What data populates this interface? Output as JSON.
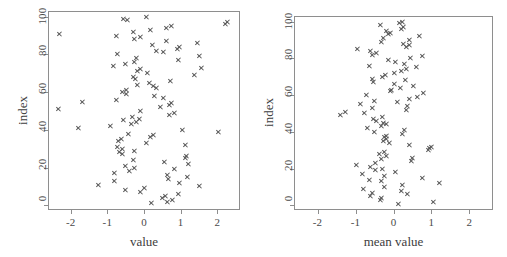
{
  "figure": {
    "width": 507,
    "height": 257,
    "background": "#ffffff",
    "marker_color": "#555555",
    "axis_color": "#8e8e8e",
    "text_color": "#3d3d3d",
    "marker_symbol": "x"
  },
  "chart_data": [
    {
      "type": "scatter",
      "title": "",
      "xlabel": "value",
      "ylabel": "index",
      "xlim": [
        -2.62,
        2.62
      ],
      "ylim": [
        -2.5,
        103
      ],
      "xticks": [
        -2,
        -1,
        0,
        1,
        2
      ],
      "xtick_labels": [
        "-2",
        "-1",
        "0",
        "1",
        "2"
      ],
      "yticks": [
        0,
        20,
        40,
        60,
        80,
        100
      ],
      "ytick_labels": [
        "0",
        "20",
        "40",
        "60",
        "80",
        "100"
      ],
      "grid": false,
      "legend": null,
      "marker": "x",
      "n_points": 100,
      "x": [
        0.21,
        0.63,
        0.78,
        0.5,
        0.57,
        0.94,
        -0.11,
        -0.52,
        0.01,
        1.51,
        -1.25,
        0.95,
        -0.8,
        0.67,
        1.18,
        0.63,
        -0.82,
        -0.4,
        0.82,
        -0.27,
        -0.51,
        1.2,
        0.56,
        -0.3,
        1.12,
        1.15,
        -0.58,
        -0.67,
        -0.26,
        -0.58,
        -0.74,
        1.13,
        0.06,
        -0.7,
        -0.63,
        0.18,
        0.26,
        -0.43,
        2.03,
        1.05,
        -1.8,
        -0.92,
        -0.36,
        -0.22,
        -0.57,
        -0.13,
        -0.33,
        0.7,
        0.83,
        -0.09,
        -2.35,
        0.44,
        0.7,
        0.74,
        -1.68,
        -0.75,
        0.52,
        0.29,
        -0.47,
        -0.59,
        -0.48,
        0.33,
        0.25,
        -0.19,
        0.15,
        0.72,
        -0.24,
        -0.3,
        1.37,
        0.08,
        -0.18,
        -0.11,
        1.57,
        -0.84,
        -0.5,
        -0.26,
        0.93,
        -0.22,
        1.5,
        -0.73,
        0.52,
        0.33,
        0.9,
        0.96,
        0.23,
        1.46,
        0.61,
        -0.27,
        -0.09,
        -0.76,
        -2.3,
        -0.29,
        0.18,
        0.61,
        0.74,
        2.22,
        2.27,
        -0.45,
        -0.57,
        0.05
      ],
      "y": [
        1,
        2,
        3,
        4,
        5,
        6,
        7,
        8,
        9,
        10,
        11,
        12,
        13,
        14,
        15,
        16,
        17,
        18,
        19,
        20,
        21,
        22,
        23,
        24,
        25,
        26,
        27,
        28,
        29,
        30,
        31,
        32,
        33,
        34,
        35,
        36,
        37,
        38,
        39,
        40,
        41,
        42,
        43,
        44,
        45,
        46,
        47,
        48,
        49,
        50,
        51,
        52,
        53,
        54,
        55,
        56,
        57,
        58,
        59,
        60,
        61,
        62,
        63,
        64,
        65,
        66,
        67,
        68,
        69,
        70,
        71,
        72,
        73,
        74,
        75,
        76,
        77,
        78,
        79,
        80,
        81,
        82,
        83,
        84,
        85,
        86,
        87,
        88,
        89,
        90,
        91,
        92,
        93,
        94,
        95,
        96,
        97,
        98,
        99,
        100
      ]
    },
    {
      "type": "scatter",
      "title": "",
      "xlabel": "mean value",
      "ylabel": "index",
      "xlim": [
        -2.62,
        2.62
      ],
      "ylim": [
        -2.5,
        103
      ],
      "xticks": [
        -2,
        -1,
        0,
        1,
        2
      ],
      "xtick_labels": [
        "-2",
        "-1",
        "0",
        "1",
        "2"
      ],
      "yticks": [
        0,
        20,
        40,
        60,
        80,
        100
      ],
      "ytick_labels": [
        "0",
        "20",
        "40",
        "60",
        "80",
        "100"
      ],
      "grid": false,
      "legend": null,
      "marker": "x",
      "n_points": 100,
      "x": [
        0.13,
        1.05,
        -0.36,
        -0.31,
        -0.62,
        0.37,
        -0.57,
        0.21,
        -0.79,
        -0.25,
        0.23,
        1.21,
        -0.31,
        -0.64,
        0.75,
        -0.23,
        -0.83,
        0.06,
        -0.48,
        -0.3,
        -0.61,
        -0.99,
        -0.48,
        0.46,
        -0.33,
        0.49,
        -0.19,
        -0.38,
        -0.24,
        0.92,
        0.95,
        1.0,
        0.41,
        -0.12,
        -0.26,
        -0.2,
        -0.24,
        -0.2,
        0.22,
        -0.5,
        0.29,
        -0.69,
        -0.33,
        -0.19,
        -0.26,
        -0.44,
        -0.54,
        -0.29,
        -1.4,
        -0.77,
        -1.28,
        0.34,
        -0.56,
        0.36,
        -0.88,
        0.1,
        -0.51,
        0.41,
        0.62,
        -0.72,
        0.79,
        -0.09,
        -0.06,
        0.19,
        0.52,
        0.03,
        -0.53,
        0.3,
        -0.57,
        -0.29,
        -0.22,
        0.03,
        0.2,
        0.34,
        0.6,
        -0.64,
        0.28,
        0.06,
        -0.13,
        0.43,
        0.76,
        -0.56,
        -0.46,
        -0.6,
        -0.95,
        0.34,
        0.41,
        0.25,
        -0.33,
        0.42,
        -0.26,
        0.67,
        -0.13,
        -0.08,
        -0.2,
        0.2,
        0.26,
        -0.36,
        0.16,
        0.22
      ],
      "y": [
        1,
        2,
        3,
        4,
        5,
        6,
        7,
        8,
        9,
        10,
        11,
        12,
        13,
        14,
        15,
        16,
        17,
        18,
        19,
        20,
        21,
        22,
        23,
        24,
        25,
        26,
        27,
        28,
        29,
        30,
        31,
        32,
        33,
        34,
        35,
        36,
        37,
        38,
        39,
        40,
        41,
        42,
        43,
        44,
        45,
        46,
        47,
        48,
        49,
        50,
        51,
        52,
        53,
        54,
        55,
        56,
        57,
        58,
        59,
        60,
        61,
        62,
        63,
        64,
        65,
        66,
        67,
        68,
        69,
        70,
        71,
        72,
        73,
        74,
        75,
        76,
        77,
        78,
        79,
        80,
        81,
        82,
        83,
        84,
        85,
        86,
        87,
        88,
        89,
        90,
        91,
        92,
        93,
        94,
        95,
        96,
        97,
        98,
        99,
        100
      ]
    }
  ],
  "panels": [
    {
      "name": "left",
      "box": {
        "left": 48,
        "top": 11,
        "width": 192,
        "height": 199
      }
    },
    {
      "name": "right",
      "box": {
        "left": 41,
        "top": 16,
        "width": 199,
        "height": 194
      }
    }
  ]
}
